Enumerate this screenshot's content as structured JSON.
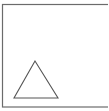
{
  "diagram": {
    "background": "#ffffff",
    "frame": {
      "shape": "rectangle",
      "stroke": "#6b6b6b",
      "x": 2.5,
      "y": 4.5,
      "width": 110,
      "height": 102.5,
      "right_edge_cropped": true
    },
    "shapes": [
      {
        "shape": "triangle",
        "stroke": "#555555",
        "fill": "none",
        "points": [
          [
            35,
            61
          ],
          [
            14,
            98
          ],
          [
            58,
            98
          ]
        ]
      }
    ]
  }
}
